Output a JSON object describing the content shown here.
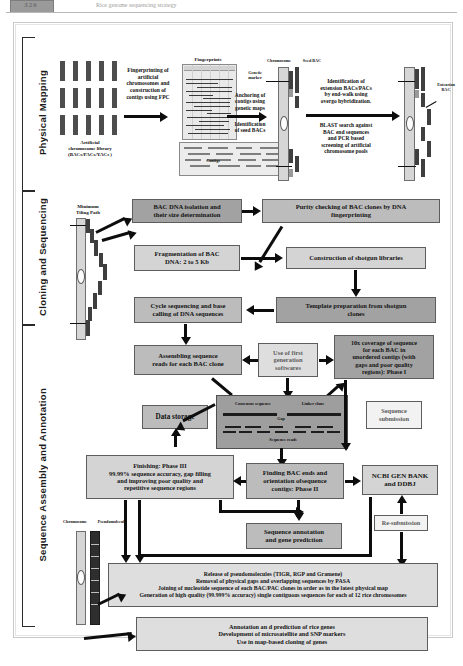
{
  "header": {
    "page_number": "326",
    "running_title": "Rice genome sequencing strategy"
  },
  "figure": {
    "sections": [
      {
        "id": "physical-mapping",
        "label": "Physical Mapping"
      },
      {
        "id": "cloning-sequencing",
        "label": "Cloning and Sequencing"
      },
      {
        "id": "assembly-annotation",
        "label": "Sequence Assembly and Annotation"
      }
    ],
    "captions": {
      "fingerprints": "Fingerprints",
      "artificial_library": "Artificial\nchromosome library\n(BACs/PACs/YACs )",
      "minimum_tiling_path": "Minimum\nTiling Path",
      "chromosome": "Chromosome",
      "seed_bac": "Seed BAC",
      "genetic_marker": "Genetic\nmarker",
      "contig": "Contigs",
      "extension_bac": "Extension\nBAC",
      "consensus_sequence": "Consensus sequence",
      "linker_clone": "Linker clone",
      "gap": "Gap",
      "sequence_reads": "Sequence reads",
      "chromosome2": "Chromosome",
      "pseudomolecule": "Pseudomolecule"
    },
    "step_labels": {
      "fingerprinting": "Fingerprinting of\nartificial\nchromosomes and\nconstruction of\ncontigs using FPC",
      "anchoring": "Anchoring of\ncontigs using\ngenetic maps",
      "identification_seed": "Identification\nof seed BACs",
      "extension_id": "Identification of\nextension BACs/PACs\nby end-walk using\novergo hybridization.",
      "blast_search": "BLAST search against\nBAC end sequences\nand PCR based\nscreening of artificial\nchromosome pools"
    },
    "boxes": [
      {
        "id": "bac-dna-isolation",
        "text": "BAC DNA isolation and\ntheir size determination"
      },
      {
        "id": "purity-checking",
        "text": "Purity checking of BAC clones by  DNA\nfingerprinting"
      },
      {
        "id": "fragmentation",
        "text": "Fragmentation of BAC\nDNA: 2 to 5 Kb"
      },
      {
        "id": "shotgun-libraries",
        "text": "Construction of  shotgun libraries"
      },
      {
        "id": "template-prep",
        "text": "Template preparation from shotgun\nclones"
      },
      {
        "id": "cycle-sequencing",
        "text": "Cycle sequencing and  base\ncalling of DNA  sequences"
      },
      {
        "id": "assembling-reads",
        "text": "Assembling sequence\nreads for  each BAC clone"
      },
      {
        "id": "first-gen-software",
        "text": "Use of first\ngeneration\nsoftwares"
      },
      {
        "id": "coverage-phase1",
        "text": "10x coverage of sequence\nfor each BAC in\nunordered contigs (with\ngaps and poor quality\nregions): Phase I"
      },
      {
        "id": "data-storage",
        "text": "Data storage"
      },
      {
        "id": "sequence-submission",
        "text": "Sequence\nsubmission"
      },
      {
        "id": "finishing-phase3",
        "text": "Finishing: Phase III\n99.99% sequence accuracy,  gap filling\nand improving poor quality and\nrepetitive sequence regions"
      },
      {
        "id": "finding-bac-ends",
        "text": "Finding BAC ends and\norientation ofsequence\ncontigs: Phase II"
      },
      {
        "id": "ncbi-genbank",
        "text": "NCBI GEN BANK\nand DDBJ"
      },
      {
        "id": "resubmission",
        "text": "Re-submission"
      },
      {
        "id": "sequence-annotation",
        "text": "Sequence annotation\nand gene prediction"
      },
      {
        "id": "release-pseudomolecules",
        "text": "Release of  pseudomolecules  (TIGR, RGP and Gramene)\nRemoval of physical gaps and overlapping sequences by PASA\nJoining of nucleotide sequence of each BAC/PAC clones in order  as in the latest physical map\nGeneration of high quality (99.999% accuracy) single contiguous sequences for each of 12 rice chromosomes"
      },
      {
        "id": "applications",
        "text": "Annotation an d prediction of rice genes\nDevelopment of microsatellite and SNP markers\nUse in map-based cloning of genes"
      }
    ],
    "colors": {
      "box_border": "#5d5d5d",
      "arrow": "#0d0d0d",
      "dark_fill": "#a2a2a2",
      "mid_fill": "#bcbcbc",
      "light_fill": "#d4d4d4",
      "pale_fill": "#dedede"
    }
  }
}
